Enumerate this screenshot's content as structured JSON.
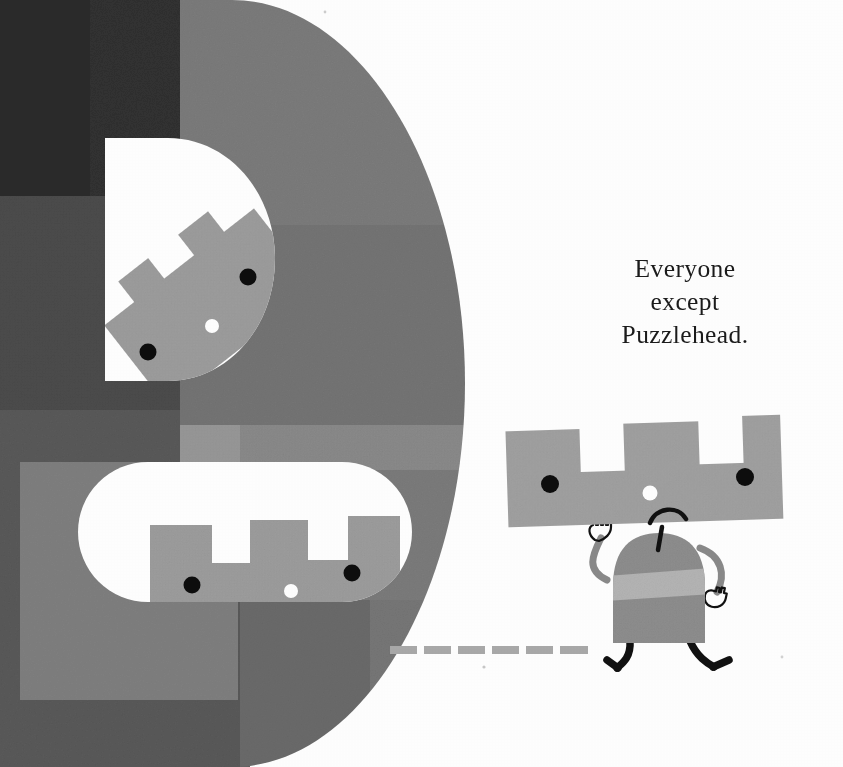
{
  "page": {
    "width": 843,
    "height": 767,
    "background": "#ffffff",
    "medium": "children's picture-book illustration",
    "caption_text": "Everyone\nexcept\nPuzzlehead.",
    "caption_lines": [
      "Everyone",
      "except",
      "Puzzlehead."
    ]
  },
  "palette": {
    "paper_white": "#ffffff",
    "darkest_block": "#2c2c2c",
    "dark_block": "#3a3a3a",
    "mid_dark_block": "#4c4c4c",
    "d_shape_gray": "#7d7d7d",
    "d_shape_gray_light": "#8d8d8d",
    "d_shape_gray_dark": "#6a6a6a",
    "overlay_light_gray": "#9a9a9a",
    "character_gray": "#a0a0a0",
    "character_body_gray": "#8f8f8f",
    "character_stripe_gray": "#b4b4b4",
    "limb_gray": "#8a8a8a",
    "ink_black": "#111111",
    "eye_black": "#0d0d0d",
    "nose_white": "#ffffff",
    "dash_gray": "#a9a9a9",
    "caption_ink": "#1b1b1b"
  },
  "scene": {
    "name": "Puzzlehead walking away from the castle wall",
    "background_blocks": [
      {
        "name": "darkest-top-left-block",
        "x": 0,
        "y": 0,
        "w": 90,
        "h": 196,
        "fill": "#2b2b2b"
      },
      {
        "name": "dark-upper-left-block",
        "x": 0,
        "y": 0,
        "w": 180,
        "h": 410,
        "fill": "#3d3d3d"
      },
      {
        "name": "dark-column-block",
        "x": 90,
        "y": 0,
        "w": 90,
        "h": 196,
        "fill": "#333333"
      },
      {
        "name": "mid-left-block",
        "x": 0,
        "y": 196,
        "w": 180,
        "h": 215,
        "fill": "#4a4a4a"
      },
      {
        "name": "mid-lower-left-block",
        "x": 0,
        "y": 410,
        "w": 180,
        "h": 357,
        "fill": "#575757"
      },
      {
        "name": "light-overlay-block",
        "x": 20,
        "y": 462,
        "w": 215,
        "h": 235,
        "fill": "#8b8b8b",
        "opacity": 0.55
      },
      {
        "name": "lower-strip-block",
        "x": 0,
        "y": 690,
        "w": 250,
        "h": 77,
        "fill": "#5e5e5e"
      }
    ],
    "d_shape": {
      "name": "large-rounded-d-form",
      "description": "large semicircular 'D' shape spanning the left half of the page",
      "left": 0,
      "top": 0,
      "width": 465,
      "height": 767,
      "fill": "#7c7c7c",
      "tone_bands": [
        {
          "name": "d-band-upper",
          "y": 0,
          "h": 225,
          "fill": "#7c7c7c"
        },
        {
          "name": "d-band-upper-mid",
          "y": 225,
          "h": 200,
          "fill": "#757575"
        },
        {
          "name": "d-band-mid",
          "y": 425,
          "h": 40,
          "fill": "#8c8c8c"
        },
        {
          "name": "d-band-lower",
          "y": 600,
          "h": 167,
          "fill": "#6e6e6e"
        }
      ]
    },
    "semicircle_window": {
      "name": "white-semicircle-window",
      "x": 105,
      "y": 138,
      "w": 170,
      "h": 243,
      "fill": "#ffffff"
    },
    "pill_window": {
      "name": "white-pill-window",
      "x": 78,
      "y": 462,
      "w": 334,
      "h": 140,
      "fill": "#ffffff"
    },
    "castle_in_semicircle": {
      "name": "castle-face-tilted",
      "rotation_deg": -32,
      "fill": "#9e9e9e",
      "eyes": 2,
      "nose": 1,
      "merlons": 3
    },
    "castle_in_pill": {
      "name": "castle-face-in-pill",
      "rotation_deg": 0,
      "fill": "#9e9e9e",
      "eyes": 2,
      "nose": 1,
      "merlons": 3
    },
    "puzzlehead": {
      "name": "puzzlehead-character",
      "head": {
        "name": "crenellated-head",
        "x": 505,
        "y": 423,
        "w": 277,
        "h": 105,
        "fill": "#a0a0a0",
        "rotation_deg": -1.8,
        "merlons": 3,
        "notches": 2
      },
      "eyes": [
        {
          "name": "left-eye",
          "cx": 550,
          "cy": 483,
          "r": 9
        },
        {
          "name": "right-eye",
          "cx": 744,
          "cy": 477,
          "r": 9
        }
      ],
      "nose": {
        "name": "nose-dot",
        "cx": 650,
        "cy": 493,
        "r": 7.5,
        "fill": "#ffffff"
      },
      "mouth": {
        "name": "frown-mouth",
        "shape": "downturned-arc",
        "cx": 668,
        "cy": 518
      },
      "neck": {
        "name": "neck-line",
        "from_y": 527,
        "to_y": 557
      },
      "body": {
        "name": "dome-body",
        "x": 613,
        "y": 535,
        "w": 92,
        "h": 108,
        "fill": "#8f8f8f",
        "stripe_fill": "#b6b6b6"
      },
      "arms": [
        {
          "name": "left-arm",
          "side": "left",
          "hand": "open-hand-up"
        },
        {
          "name": "right-arm",
          "side": "right",
          "hand": "open-hand-down"
        }
      ],
      "legs": [
        {
          "name": "left-leg",
          "side": "left",
          "pose": "back-step"
        },
        {
          "name": "right-leg",
          "side": "right",
          "pose": "forward-step"
        }
      ]
    },
    "dashed_trail": {
      "name": "dashed-trail",
      "y": 650,
      "fill": "#a9a9a9",
      "dash_count": 6,
      "dash_width": 27,
      "dash_gap": 7,
      "dash_height": 8,
      "start_x": 390
    }
  }
}
